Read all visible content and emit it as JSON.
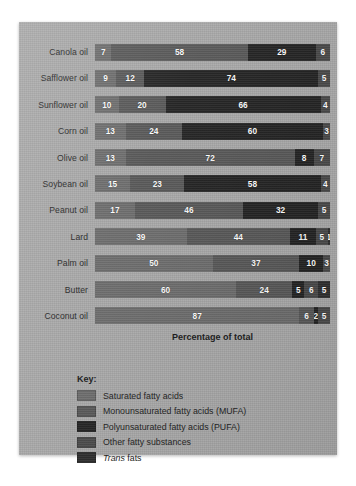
{
  "chart_data": {
    "type": "bar",
    "orientation": "horizontal",
    "stacked": true,
    "title": "",
    "xlabel": "Percentage of total",
    "ylabel": "",
    "xlim": [
      0,
      100
    ],
    "grid": false,
    "legend_position": "bottom-left",
    "legend_title": "Key:",
    "categories": [
      "Canola oil",
      "Safflower oil",
      "Sunflower oil",
      "Corn oil",
      "Olive oil",
      "Soybean oil",
      "Peanut oil",
      "Lard",
      "Palm oil",
      "Butter",
      "Coconut oil"
    ],
    "series": [
      {
        "name": "Saturated fatty acids",
        "color": "#6d6d6d",
        "values": [
          7,
          9,
          10,
          13,
          13,
          15,
          17,
          39,
          50,
          60,
          87
        ]
      },
      {
        "name": "Monounsaturated fatty acids (MUFA)",
        "color": "#585858",
        "values": [
          58,
          12,
          20,
          24,
          72,
          23,
          46,
          44,
          37,
          24,
          6
        ]
      },
      {
        "name": "Polyunsaturated fatty acids (PUFA)",
        "color": "#242424",
        "values": [
          29,
          74,
          66,
          60,
          8,
          58,
          32,
          11,
          10,
          5,
          2
        ]
      },
      {
        "name": "Other fatty substances",
        "color": "#4a4a4a",
        "values": [
          6,
          5,
          4,
          3,
          7,
          4,
          5,
          5,
          3,
          6,
          5
        ]
      },
      {
        "name": "Trans fats",
        "color": "#2f2f2f",
        "values": [
          0,
          0,
          0,
          0,
          0,
          0,
          0,
          1,
          0,
          5,
          0
        ]
      }
    ],
    "rows": [
      {
        "label": "Canola oil",
        "segments": [
          {
            "key": "sat",
            "value": 7,
            "label": "7"
          },
          {
            "key": "mufa",
            "value": 58,
            "label": "58"
          },
          {
            "key": "pufa",
            "value": 29,
            "label": "29"
          },
          {
            "key": "other",
            "value": 6,
            "label": "6"
          }
        ]
      },
      {
        "label": "Safflower oil",
        "segments": [
          {
            "key": "sat",
            "value": 9,
            "label": "9"
          },
          {
            "key": "mufa",
            "value": 12,
            "label": "12"
          },
          {
            "key": "pufa",
            "value": 74,
            "label": "74"
          },
          {
            "key": "other",
            "value": 5,
            "label": "5"
          }
        ]
      },
      {
        "label": "Sunflower oil",
        "segments": [
          {
            "key": "sat",
            "value": 10,
            "label": "10"
          },
          {
            "key": "mufa",
            "value": 20,
            "label": "20"
          },
          {
            "key": "pufa",
            "value": 66,
            "label": "66"
          },
          {
            "key": "other",
            "value": 4,
            "label": "4"
          }
        ]
      },
      {
        "label": "Corn oil",
        "segments": [
          {
            "key": "sat",
            "value": 13,
            "label": "13"
          },
          {
            "key": "mufa",
            "value": 24,
            "label": "24"
          },
          {
            "key": "pufa",
            "value": 60,
            "label": "60"
          },
          {
            "key": "other",
            "value": 3,
            "label": "3"
          }
        ]
      },
      {
        "label": "Olive oil",
        "segments": [
          {
            "key": "sat",
            "value": 13,
            "label": "13"
          },
          {
            "key": "mufa",
            "value": 72,
            "label": "72"
          },
          {
            "key": "pufa",
            "value": 8,
            "label": "8"
          },
          {
            "key": "other",
            "value": 7,
            "label": "7"
          }
        ]
      },
      {
        "label": "Soybean oil",
        "segments": [
          {
            "key": "sat",
            "value": 15,
            "label": "15"
          },
          {
            "key": "mufa",
            "value": 23,
            "label": "23"
          },
          {
            "key": "pufa",
            "value": 58,
            "label": "58"
          },
          {
            "key": "other",
            "value": 4,
            "label": "4"
          }
        ]
      },
      {
        "label": "Peanut oil",
        "segments": [
          {
            "key": "sat",
            "value": 17,
            "label": "17"
          },
          {
            "key": "mufa",
            "value": 46,
            "label": "46"
          },
          {
            "key": "pufa",
            "value": 32,
            "label": "32"
          },
          {
            "key": "other",
            "value": 5,
            "label": "5"
          }
        ]
      },
      {
        "label": "Lard",
        "segments": [
          {
            "key": "sat",
            "value": 39,
            "label": "39"
          },
          {
            "key": "mufa",
            "value": 44,
            "label": "44"
          },
          {
            "key": "pufa",
            "value": 11,
            "label": "11"
          },
          {
            "key": "other",
            "value": 5,
            "label": "5"
          },
          {
            "key": "trans",
            "value": 1,
            "label": "1"
          }
        ]
      },
      {
        "label": "Palm oil",
        "segments": [
          {
            "key": "sat",
            "value": 50,
            "label": "50"
          },
          {
            "key": "mufa",
            "value": 37,
            "label": "37"
          },
          {
            "key": "pufa",
            "value": 10,
            "label": "10"
          },
          {
            "key": "other",
            "value": 3,
            "label": "3"
          }
        ]
      },
      {
        "label": "Butter",
        "segments": [
          {
            "key": "sat",
            "value": 60,
            "label": "60"
          },
          {
            "key": "mufa",
            "value": 24,
            "label": "24"
          },
          {
            "key": "pufa",
            "value": 5,
            "label": "5"
          },
          {
            "key": "other",
            "value": 6,
            "label": "6"
          },
          {
            "key": "trans",
            "value": 5,
            "label": "5"
          }
        ]
      },
      {
        "label": "Coconut oil",
        "segments": [
          {
            "key": "sat",
            "value": 87,
            "label": "87"
          },
          {
            "key": "mufa",
            "value": 6,
            "label": "6"
          },
          {
            "key": "pufa",
            "value": 2,
            "label": "2"
          },
          {
            "key": "other",
            "value": 5,
            "label": "5"
          }
        ]
      }
    ],
    "legend": [
      {
        "label": "Saturated fatty acids",
        "key": "sat",
        "color": "#6d6d6d",
        "italic_prefix": ""
      },
      {
        "label": "Monounsaturated fatty acids (MUFA)",
        "key": "mufa",
        "color": "#585858",
        "italic_prefix": ""
      },
      {
        "label": "Polyunsaturated fatty acids (PUFA)",
        "key": "pufa",
        "color": "#242424",
        "italic_prefix": ""
      },
      {
        "label": "Other fatty substances",
        "key": "other",
        "color": "#4a4a4a",
        "italic_prefix": ""
      },
      {
        "label": "fats",
        "key": "trans",
        "color": "#2f2f2f",
        "italic_prefix": "Trans"
      }
    ]
  },
  "colors": {
    "panel_background": "#a7a7a7",
    "page_background": "#ffffff",
    "text": "#242424"
  }
}
